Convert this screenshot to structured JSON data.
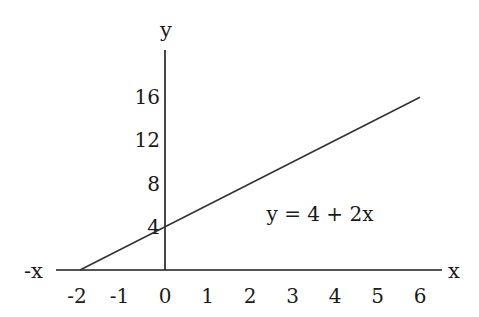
{
  "chart_data": {
    "type": "line",
    "title": "",
    "xlabel": "x",
    "xlabel_negative": "-x",
    "ylabel": "y",
    "x_ticks": [
      -2,
      -1,
      0,
      1,
      2,
      3,
      4,
      5,
      6
    ],
    "y_ticks": [
      4,
      8,
      12,
      16
    ],
    "xlim": [
      -2.6,
      6.5
    ],
    "ylim": [
      0,
      20
    ],
    "grid": false,
    "series": [
      {
        "name": "y = 4 + 2x",
        "x": [
          -2,
          6
        ],
        "y": [
          0,
          16
        ]
      }
    ],
    "annotations": [
      {
        "text": "y = 4 + 2x",
        "x": 3.5,
        "y": 5
      }
    ]
  },
  "style": {
    "axis_color": "#1a1a1a",
    "line_color": "#333333",
    "background": "#ffffff"
  }
}
